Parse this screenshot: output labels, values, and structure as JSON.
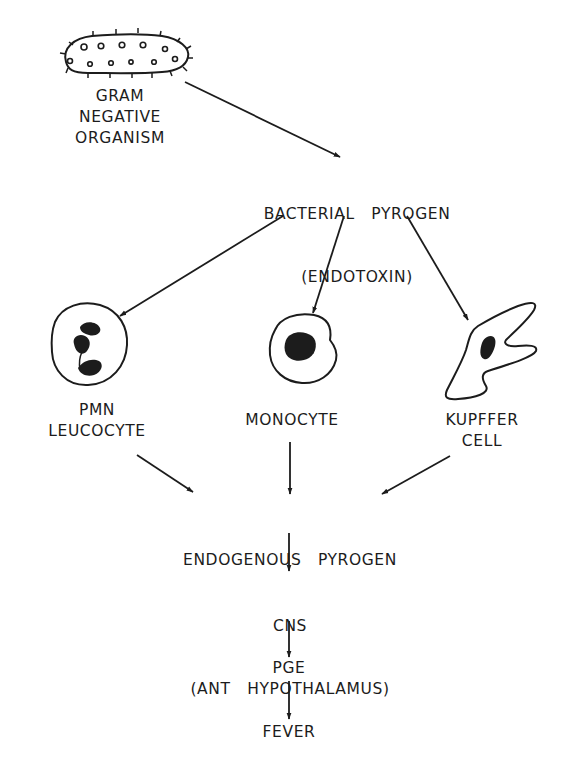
{
  "diagram": {
    "type": "flowchart",
    "nodes": {
      "organism": {
        "lines": [
          "GRAM",
          "NEGATIVE",
          "ORGANISM"
        ],
        "icon": "bacterium-icon"
      },
      "bacterial_pyrogen": {
        "lines": [
          "BACTERIAL   PYROGEN",
          "(ENDOTOXIN)"
        ]
      },
      "pmn": {
        "lines": [
          "PMN",
          "LEUCOCYTE"
        ],
        "icon": "pmn-leucocyte-icon"
      },
      "monocyte": {
        "lines": [
          "MONOCYTE"
        ],
        "icon": "monocyte-icon"
      },
      "kupffer": {
        "lines": [
          "KUPFFER",
          "CELL"
        ],
        "icon": "kupffer-cell-icon"
      },
      "endogenous_pyrogen": {
        "lines": [
          "ENDOGENOUS   PYROGEN"
        ]
      },
      "cns": {
        "lines": [
          "CNS",
          "(ANT   HYPOTHALAMUS)"
        ]
      },
      "pge": {
        "lines": [
          "PGE"
        ]
      },
      "fever": {
        "lines": [
          "FEVER"
        ]
      }
    },
    "edges": [
      {
        "from": "organism",
        "to": "bacterial_pyrogen"
      },
      {
        "from": "bacterial_pyrogen",
        "to": "pmn"
      },
      {
        "from": "bacterial_pyrogen",
        "to": "monocyte"
      },
      {
        "from": "bacterial_pyrogen",
        "to": "kupffer"
      },
      {
        "from": "pmn",
        "to": "endogenous_pyrogen"
      },
      {
        "from": "monocyte",
        "to": "endogenous_pyrogen"
      },
      {
        "from": "kupffer",
        "to": "endogenous_pyrogen"
      },
      {
        "from": "endogenous_pyrogen",
        "to": "cns"
      },
      {
        "from": "cns",
        "to": "pge"
      },
      {
        "from": "pge",
        "to": "fever"
      }
    ],
    "colors": {
      "ink": "#1c1c1c",
      "background": "#ffffff"
    }
  }
}
